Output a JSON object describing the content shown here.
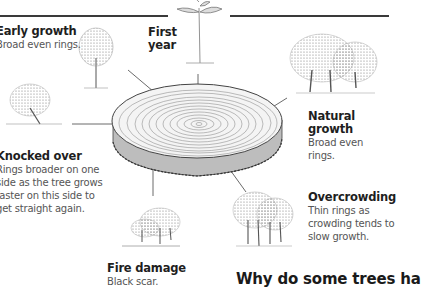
{
  "page": {
    "heading": "Why do some trees ha"
  },
  "labels": {
    "early_growth": {
      "title": "Early growth",
      "desc": "Broad even rings."
    },
    "first_year": {
      "title_line1": "First",
      "title_line2": "year"
    },
    "natural_growth": {
      "title": "Natural growth",
      "desc": "Broad even rings."
    },
    "knocked_over": {
      "title": "Knocked over",
      "desc_lines": [
        "Rings broader on one",
        "side as the tree grows",
        "faster on this side to",
        "get straight again."
      ]
    },
    "overcrowding": {
      "title": "Overcrowding",
      "desc_lines": [
        "Thin rings as",
        "crowding tends to",
        "slow growth."
      ]
    },
    "fire_damage": {
      "title": "Fire damage",
      "desc": "Black scar."
    }
  },
  "illustrations": {
    "center": "tree-ring-cross-section",
    "items": [
      "single-young-tree",
      "seedling",
      "group-of-mature-trees",
      "leaning-tree",
      "dense-tree-cluster",
      "burnt-trees"
    ]
  },
  "colors": {
    "rule": "#3a3a3a",
    "text_title": "#1e1e1e",
    "text_desc": "#555555",
    "sketch": "#6b6b6b"
  }
}
